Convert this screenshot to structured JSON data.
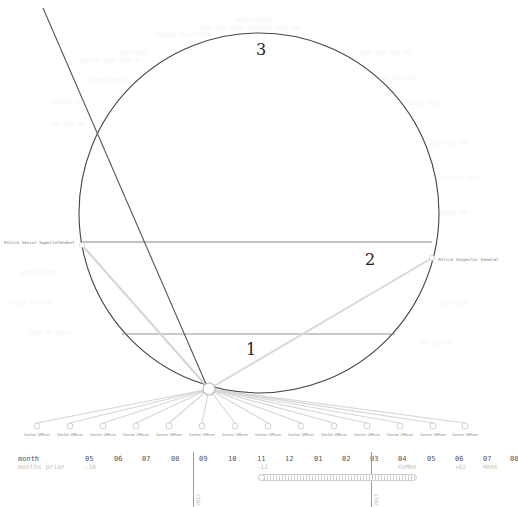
{
  "diagram": {
    "zones": [
      {
        "id": "zone-3",
        "label": "3",
        "x": 256,
        "y": 40
      },
      {
        "id": "zone-2",
        "label": "2",
        "x": 365,
        "y": 250
      },
      {
        "id": "zone-1",
        "label": "1",
        "x": 246,
        "y": 340
      }
    ],
    "ranks": {
      "left": {
        "label": "Police Senior Superintendent",
        "x": 4,
        "y": 240
      },
      "right": {
        "label": "Police Inspector General",
        "x": 438,
        "y": 257
      }
    },
    "hub": {
      "x": 209,
      "y": 389,
      "r": 6
    },
    "circle": {
      "cx": 259,
      "cy": 213,
      "r": 180,
      "color": "#444444"
    },
    "lines": {
      "dark_diagonal": {
        "x1": 43,
        "y1": 8,
        "x2": 206,
        "y2": 384,
        "color": "#555555"
      },
      "upper_chord": {
        "x1": 80,
        "y1": 242,
        "x2": 432,
        "y2": 242,
        "color": "#777777"
      },
      "lower_chord": {
        "x1": 122,
        "y1": 334,
        "x2": 395,
        "y2": 334,
        "color": "#888888"
      }
    },
    "officers": [
      {
        "label": "Sector Officer",
        "x": 37
      },
      {
        "label": "Sector Officer",
        "x": 70
      },
      {
        "label": "Sector Officer",
        "x": 103
      },
      {
        "label": "Sector Officer",
        "x": 136
      },
      {
        "label": "Sector Officer",
        "x": 169
      },
      {
        "label": "Sector Officer",
        "x": 202
      },
      {
        "label": "Sector Officer",
        "x": 235
      },
      {
        "label": "Sector Officer",
        "x": 268
      },
      {
        "label": "Sector Officer",
        "x": 301
      },
      {
        "label": "Sector Officer",
        "x": 334
      },
      {
        "label": "Sector Officer",
        "x": 367
      },
      {
        "label": "Sector Officer",
        "x": 400
      },
      {
        "label": "Sector Officer",
        "x": 433
      },
      {
        "label": "Sector Officer",
        "x": 465
      }
    ],
    "officer_row_y": 426
  },
  "timeline": {
    "row_label": "month",
    "sub_label": "months prior",
    "months": [
      {
        "label": "05",
        "x": 85,
        "sub": "-38"
      },
      {
        "label": "06",
        "x": 114,
        "sub": ""
      },
      {
        "label": "07",
        "x": 142,
        "sub": ""
      },
      {
        "label": "08",
        "x": 171,
        "sub": ""
      },
      {
        "label": "09",
        "x": 199,
        "sub": ""
      },
      {
        "label": "10",
        "x": 228,
        "sub": ""
      },
      {
        "label": "11",
        "x": 257,
        "sub": "-12"
      },
      {
        "label": "12",
        "x": 285,
        "sub": ""
      },
      {
        "label": "01",
        "x": 314,
        "sub": ""
      },
      {
        "label": "02",
        "x": 342,
        "sub": ""
      },
      {
        "label": "03",
        "x": 370,
        "sub": ""
      },
      {
        "label": "04",
        "x": 398,
        "sub": "KUMBH"
      },
      {
        "label": "05",
        "x": 427,
        "sub": ""
      },
      {
        "label": "06",
        "x": 455,
        "sub": "+02"
      },
      {
        "label": "07",
        "x": 483,
        "sub": "MAHA"
      },
      {
        "label": "08",
        "x": 510,
        "sub": ""
      }
    ],
    "year_marks": [
      {
        "label": "2012",
        "x": 193
      },
      {
        "label": "2013",
        "x": 371
      }
    ],
    "range_slider": {
      "start_x": 258,
      "end_x": 417
    }
  }
}
